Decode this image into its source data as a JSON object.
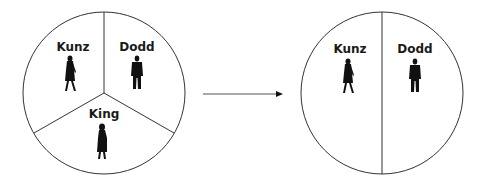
{
  "diagram": {
    "before": {
      "segments": [
        {
          "label": "Kunz",
          "figure": "woman-walking"
        },
        {
          "label": "Dodd",
          "figure": "man-standing"
        },
        {
          "label": "King",
          "figure": "woman-standing"
        }
      ]
    },
    "arrow": {
      "direction": "right"
    },
    "after": {
      "segments": [
        {
          "label": "Kunz",
          "figure": "woman-walking"
        },
        {
          "label": "Dodd",
          "figure": "man-standing"
        }
      ]
    }
  }
}
